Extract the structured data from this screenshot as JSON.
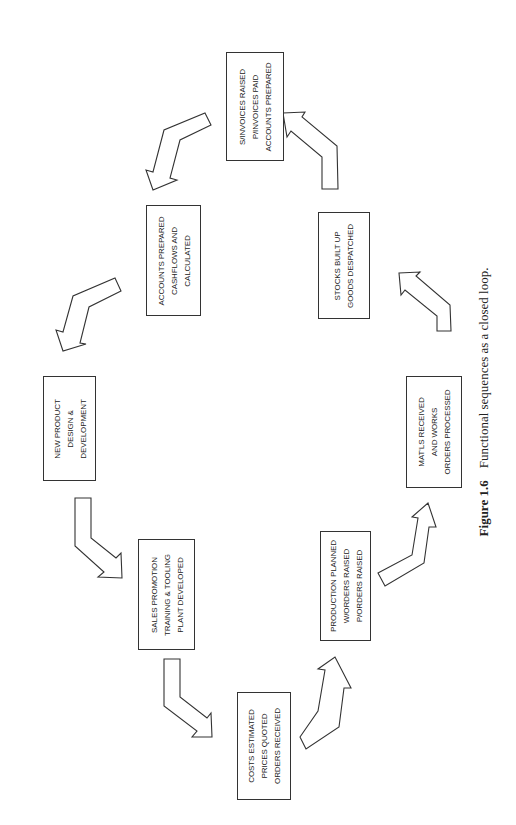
{
  "figure": {
    "label": "Figure 1.6",
    "caption": "Functional sequences as a closed loop."
  },
  "boxes": [
    {
      "id": "invoices",
      "lines": [
        "S/INVOICES RAISED",
        "P/INVOICES PAID",
        "ACCOUNTS PREPARED"
      ]
    },
    {
      "id": "accounts",
      "lines": [
        "ACCOUNTS PREPARED",
        "CASHFLOWS AND",
        "CALCULATED"
      ]
    },
    {
      "id": "new-product",
      "lines": [
        "NEW PRODUCT",
        "DESIGN &",
        "DEVELOPMENT"
      ]
    },
    {
      "id": "sales",
      "lines": [
        "SALES PROMOTION",
        "TRAINING & TOOLING",
        "PLANT DEVELOPED"
      ]
    },
    {
      "id": "costs",
      "lines": [
        "COSTS ESTIMATED",
        "PRICES QUOTED",
        "ORDERS RECEIVED"
      ]
    },
    {
      "id": "production",
      "lines": [
        "PRODUCTION PLANNED",
        "W/ORDERS RAISED",
        "P/ORDERS RAISED"
      ]
    },
    {
      "id": "materials",
      "lines": [
        "MAT'LS RECEIVED",
        "AND WORKS",
        "ORDERS PROCESSED"
      ]
    },
    {
      "id": "stocks",
      "lines": [
        "STOCKS BUILT UP",
        "GOODS DESPATCHED"
      ]
    }
  ],
  "colors": {
    "stroke": "#333333",
    "fill": "#ffffff",
    "text": "#222222"
  }
}
